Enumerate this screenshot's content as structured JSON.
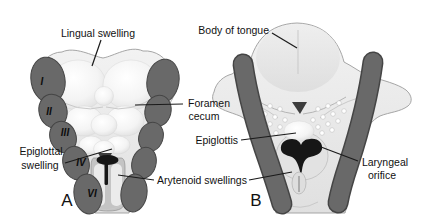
{
  "figure": {
    "colors": {
      "background": "#ffffff",
      "arch_fill": "#696969",
      "arch_edge": "#454545",
      "flesh_edge": "#9c9c9c",
      "orifice_black": "#161616",
      "label_text": "#111111"
    },
    "panel_a": {
      "letter": "A",
      "arch_numerals": [
        "I",
        "II",
        "III",
        "IV",
        "VI"
      ],
      "labels": {
        "lingual_swelling": "Lingual swelling",
        "foramen_cecum": [
          "Foramen",
          "cecum"
        ],
        "epiglottal_swelling": [
          "Epiglottal",
          "swelling"
        ]
      }
    },
    "panel_b": {
      "letter": "B",
      "labels": {
        "body_of_tongue": "Body of tongue",
        "epiglottis": "Epiglottis",
        "laryngeal_orifice": [
          "Laryngeal",
          "orifice"
        ]
      }
    },
    "shared_labels": {
      "arytenoid_swellings": "Arytenoid swellings"
    }
  }
}
